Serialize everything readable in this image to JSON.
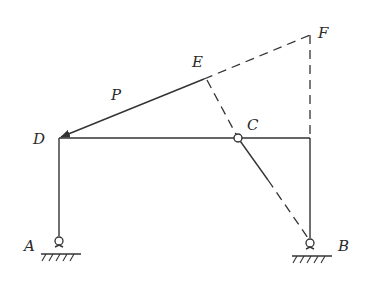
{
  "diagram": {
    "type": "plane frame with hinge",
    "labels": {
      "A": "A",
      "B": "B",
      "C": "C",
      "D": "D",
      "E": "E",
      "F": "F",
      "P": "P"
    },
    "points": {
      "A": [
        59,
        241
      ],
      "B": [
        310,
        243
      ],
      "C": [
        238,
        138
      ],
      "D": [
        59,
        138
      ],
      "E": [
        204,
        79
      ],
      "F": [
        310,
        35
      ],
      "right_top": [
        310,
        138
      ]
    },
    "members": [
      {
        "from": "A",
        "to": "D",
        "style": "solid"
      },
      {
        "from": "D",
        "to": "right_top",
        "style": "solid"
      },
      {
        "from": "right_top",
        "to": "B",
        "style": "solid"
      }
    ],
    "construction_lines": [
      {
        "from": "E",
        "to": "F",
        "style": "dashed"
      },
      {
        "from": "F",
        "to": "right_top",
        "style": "dashed"
      },
      {
        "from": "E",
        "to": "B",
        "style": "dashed",
        "through": "C"
      }
    ],
    "force": {
      "label": "P",
      "from": "E",
      "to": "D",
      "style": "arrow"
    },
    "supports": [
      {
        "at": "A",
        "type": "pin"
      },
      {
        "at": "B",
        "type": "pin"
      }
    ],
    "hinge": {
      "at": "C"
    },
    "line_color": "#333333"
  }
}
